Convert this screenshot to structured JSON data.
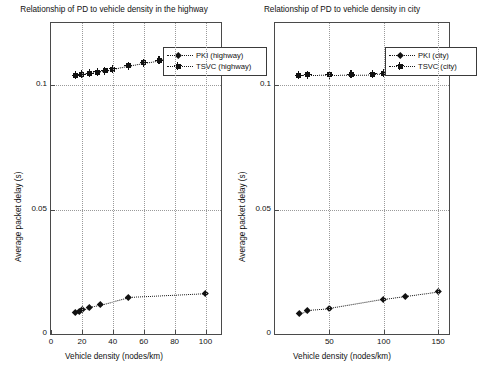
{
  "figure": {
    "background": "#ffffff",
    "ink_color": "#111111",
    "grid_color": "#9a9a9a"
  },
  "chart_data": [
    {
      "id": "highway",
      "type": "scatter",
      "title": "Relationship of PD to vehicle density in the highway",
      "xlabel": "Vehicle density (nodes/km)",
      "ylabel": "Average packet delay (s)",
      "xlim": [
        0,
        110
      ],
      "ylim": [
        0,
        0.125
      ],
      "xticks": [
        0,
        20,
        40,
        60,
        80,
        100
      ],
      "xticklabels": [
        "0",
        "20",
        "40",
        "60",
        "80",
        "100"
      ],
      "yticks": [
        0,
        0.05,
        0.1
      ],
      "yticklabels": [
        "0",
        "0.05",
        "0.1"
      ],
      "grid": true,
      "legend_position": "top-right",
      "series": [
        {
          "name": "PKI (highway)",
          "marker": "diamond",
          "linestyle": "dotted",
          "x": [
            16,
            18,
            20,
            25,
            32,
            50,
            100
          ],
          "y": [
            0.0088,
            0.0092,
            0.0098,
            0.0108,
            0.0118,
            0.0148,
            0.0163
          ]
        },
        {
          "name": "TSVC (highway)",
          "marker": "star",
          "linestyle": "dotted",
          "x": [
            16,
            20,
            25,
            30,
            35,
            40,
            50,
            60,
            70,
            80,
            90,
            100
          ],
          "y": [
            0.104,
            0.1044,
            0.1048,
            0.1053,
            0.1058,
            0.1065,
            0.1078,
            0.109,
            0.11,
            0.1108,
            0.1113,
            0.1118
          ]
        }
      ]
    },
    {
      "id": "city",
      "type": "scatter",
      "title": "Relationship of PD to vehicle density in city",
      "xlabel": "Vehicle density (nodes/km)",
      "ylabel": "Average packet delay (s)",
      "xlim": [
        0,
        160
      ],
      "ylim": [
        0,
        0.125
      ],
      "xticks": [
        50,
        100,
        150
      ],
      "xticklabels": [
        "50",
        "100",
        "150"
      ],
      "yticks": [
        0,
        0.05,
        0.1
      ],
      "yticklabels": [
        "0",
        "0.05",
        "0.1"
      ],
      "grid": true,
      "legend_position": "top-right",
      "series": [
        {
          "name": "PKI (city)",
          "marker": "diamond",
          "linestyle": "dotted",
          "x": [
            22,
            30,
            50,
            100,
            120,
            150
          ],
          "y": [
            0.0082,
            0.0096,
            0.0103,
            0.014,
            0.0152,
            0.017
          ]
        },
        {
          "name": "TSVC (city)",
          "marker": "star",
          "linestyle": "dotted",
          "x": [
            22,
            30,
            50,
            70,
            90,
            100,
            110,
            120,
            130,
            140,
            150
          ],
          "y": [
            0.104,
            0.1041,
            0.1042,
            0.1043,
            0.1045,
            0.1047,
            0.1055,
            0.1068,
            0.1085,
            0.1102,
            0.1128
          ]
        }
      ]
    }
  ]
}
